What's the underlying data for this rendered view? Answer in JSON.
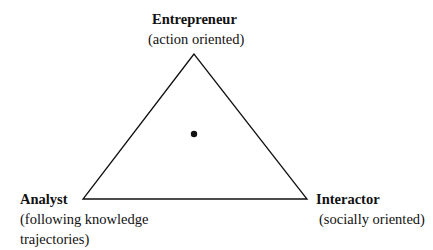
{
  "diagram": {
    "type": "triangle",
    "line_color": "#111111",
    "vertices": {
      "top": {
        "x": 194,
        "y": 54
      },
      "bottom_left": {
        "x": 83,
        "y": 199
      },
      "bottom_right": {
        "x": 307,
        "y": 199
      }
    },
    "center_point": {
      "x": 194,
      "y": 134,
      "radius": 3.2
    }
  },
  "nodes": {
    "top": {
      "title": "Entrepreneur",
      "subtitle": "(action oriented)"
    },
    "bottom_left": {
      "title": "Analyst",
      "subtitle_line1": "(following knowledge",
      "subtitle_line2": "trajectories)"
    },
    "bottom_right": {
      "title": "Interactor",
      "subtitle": "(socially oriented)"
    }
  }
}
